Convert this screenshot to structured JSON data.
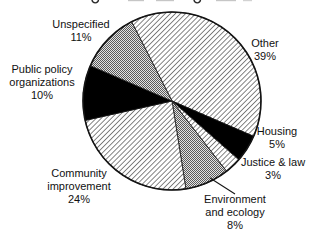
{
  "chart_data": {
    "type": "pie",
    "start_angle_deg_cw_from_top": -27,
    "legend": "none",
    "slices": [
      {
        "label": "Other",
        "value": 39,
        "pattern": "diagonal-hatch"
      },
      {
        "label": "Housing",
        "value": 5,
        "pattern": "solid-black"
      },
      {
        "label": "Justice & law",
        "value": 3,
        "pattern": "diagonal-hatch"
      },
      {
        "label": "Environment and ecology",
        "value": 8,
        "pattern": "gray-stipple"
      },
      {
        "label": "Community improvement",
        "value": 24,
        "pattern": "diagonal-hatch"
      },
      {
        "label": "Public policy organizations",
        "value": 10,
        "pattern": "solid-black"
      },
      {
        "label": "Unspecified",
        "value": 11,
        "pattern": "gray-stipple"
      }
    ],
    "colors": {
      "hatch_line": "#141414",
      "solid": "#000000",
      "stipple_dark": "#5a5a5a",
      "stipple_light": "#e3e3e3",
      "outline": "#141414",
      "background": "#ffffff"
    }
  },
  "labels": {
    "unspecified": [
      "Unspecified",
      "11%"
    ],
    "other": [
      "Other",
      "39%"
    ],
    "public_policy": [
      "Public policy",
      "organizations",
      "10%"
    ],
    "housing": [
      "Housing",
      "5%"
    ],
    "justice": [
      "Justice & law",
      "3%"
    ],
    "environment": [
      "Environment",
      "and ecology",
      "8%"
    ],
    "community": [
      "Community",
      "improvement",
      "24%"
    ]
  }
}
